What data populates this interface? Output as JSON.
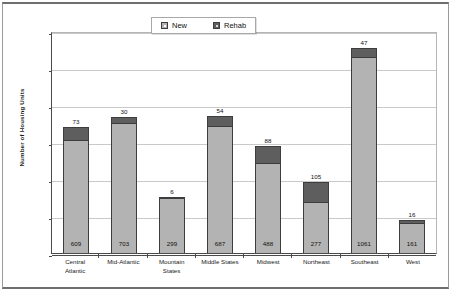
{
  "chart_data": {
    "type": "bar",
    "subtype": "stacked-bar",
    "title": "",
    "xlabel": "",
    "ylabel": "Number of Housing Units",
    "ylim": [
      0,
      1200
    ],
    "ytick_values": [
      1200,
      1000,
      800,
      600,
      400,
      200,
      0
    ],
    "ytick_labels": [
      "1200",
      "1000",
      "800",
      "600",
      "400",
      "200",
      "0"
    ],
    "grid": true,
    "legend_position": "top-center",
    "categories": [
      "Central Atlantic",
      "Mid-Atlantic",
      "Mountain States",
      "Middle States",
      "Midwest",
      "Northeast",
      "Southeast",
      "West"
    ],
    "category_lines": [
      [
        "Central",
        "Atlantic"
      ],
      [
        "Mid-Atlantic"
      ],
      [
        "Mountain",
        "States"
      ],
      [
        "Middle States"
      ],
      [
        "Midwest"
      ],
      [
        "Northeast"
      ],
      [
        "Southeast"
      ],
      [
        "West"
      ]
    ],
    "series": [
      {
        "name": "New",
        "color": "#b3b3b3",
        "values": [
          609,
          703,
          299,
          687,
          488,
          277,
          1061,
          161
        ]
      },
      {
        "name": "Rehab",
        "color": "#5e5e5e",
        "values": [
          73,
          30,
          6,
          54,
          88,
          105,
          47,
          16
        ]
      }
    ],
    "totals": [
      682,
      733,
      305,
      741,
      576,
      382,
      1108,
      177
    ]
  },
  "legend": {
    "entries": [
      {
        "label": "New",
        "swatch": "legend-swatch-new"
      },
      {
        "label": "Rehab",
        "swatch": "legend-swatch-rehab"
      }
    ]
  }
}
